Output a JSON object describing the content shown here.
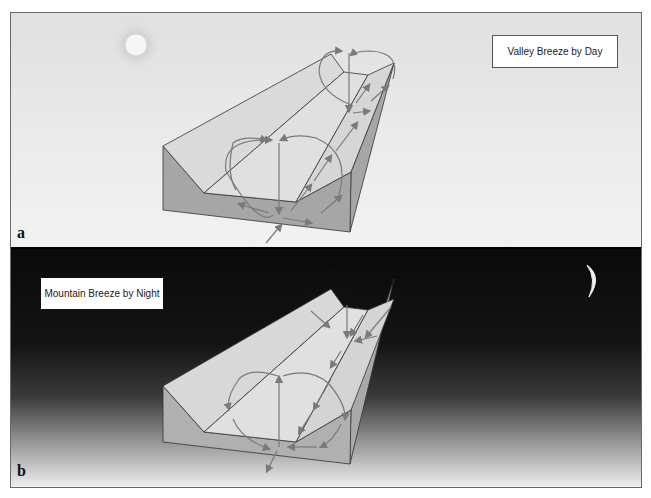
{
  "figure": {
    "panels": [
      {
        "id": "a",
        "letter": "a",
        "title": "Valley Breeze by Day",
        "time_of_day": "day",
        "celestial_icon": "sun-icon",
        "sky_color_top": "#e0e0e0",
        "sky_color_bottom": "#f2f2f2",
        "flow_description": "Air rises up the valley slopes and up-valley toward the head; circulation cells return aloft"
      },
      {
        "id": "b",
        "letter": "b",
        "title": "Mountain Breeze by Night",
        "time_of_day": "night",
        "celestial_icon": "crescent-moon-icon",
        "sky_color_top": "#0a0a0a",
        "sky_color_bottom": "#eeeeee",
        "flow_description": "Air drains down the slopes and down-valley; circulation cells reversed"
      }
    ],
    "colors": {
      "terrain_top": "#d9d9d9",
      "terrain_side": "#a6a6a6",
      "terrain_outline": "#333333",
      "arrow": "#7a7a7a",
      "arrow_night_aloft": "#111111"
    }
  }
}
